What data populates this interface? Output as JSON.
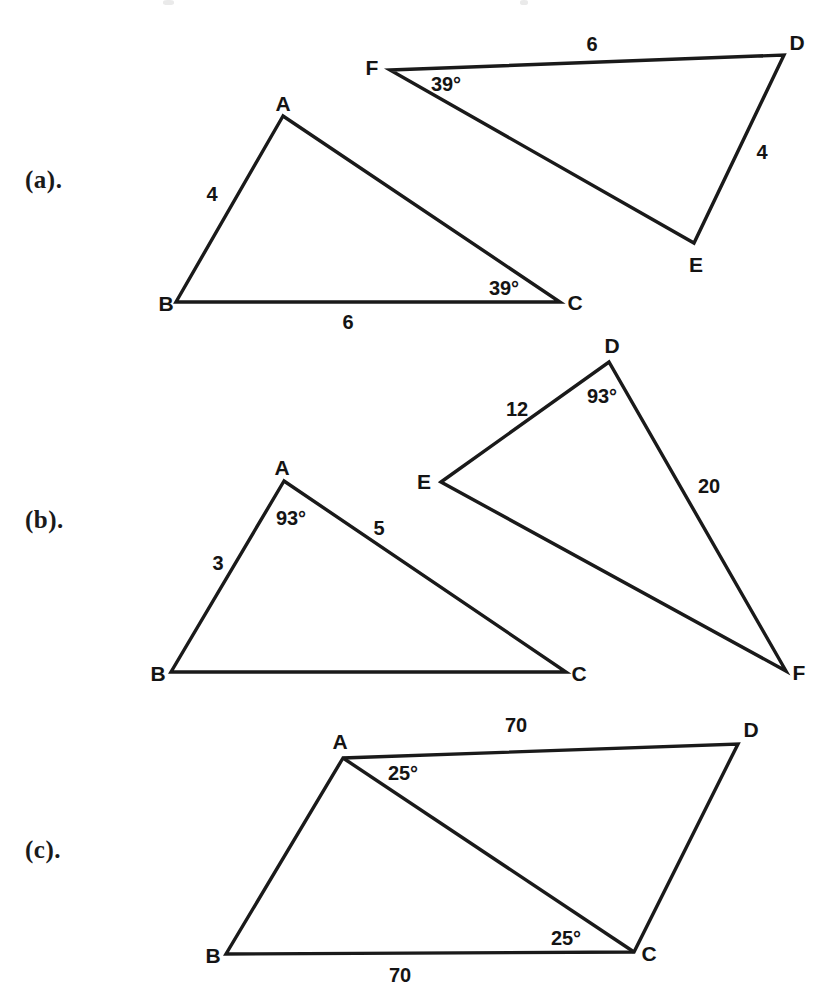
{
  "figure": {
    "stroke_color": "#1a1a1a",
    "background_color": "#ffffff",
    "width": 823,
    "height": 997,
    "parts": [
      {
        "id": "a",
        "label": "(a).",
        "label_x": 25,
        "label_y": 166,
        "shapes": [
          {
            "name": "triangle-abc",
            "points": "283,116 176,302 560,302",
            "closed": true,
            "stroke_width": 3.4
          },
          {
            "name": "triangle-def",
            "points": "390,70 784,55 694,243",
            "closed": true,
            "stroke_width": 3.4
          }
        ],
        "vertices": [
          {
            "name": "vertex-label-a",
            "text": "A",
            "x": 283,
            "y": 104
          },
          {
            "name": "vertex-label-b",
            "text": "B",
            "x": 166,
            "y": 304
          },
          {
            "name": "vertex-label-c",
            "text": "C",
            "x": 575,
            "y": 303
          },
          {
            "name": "vertex-label-d",
            "text": "D",
            "x": 797,
            "y": 43
          },
          {
            "name": "vertex-label-e",
            "text": "E",
            "x": 696,
            "y": 265
          },
          {
            "name": "vertex-label-f",
            "text": "F",
            "x": 372,
            "y": 68
          }
        ],
        "measures": [
          {
            "name": "side-length-ab",
            "text": "4",
            "x": 212,
            "y": 194
          },
          {
            "name": "side-length-bc",
            "text": "6",
            "x": 348,
            "y": 322
          },
          {
            "name": "angle-c",
            "text": "39°",
            "x": 504,
            "y": 288
          },
          {
            "name": "side-length-fd",
            "text": "6",
            "x": 592,
            "y": 44
          },
          {
            "name": "side-length-de",
            "text": "4",
            "x": 762,
            "y": 152
          },
          {
            "name": "angle-f",
            "text": "39°",
            "x": 446,
            "y": 84
          }
        ]
      },
      {
        "id": "b",
        "label": "(b).",
        "label_x": 25,
        "label_y": 506,
        "shapes": [
          {
            "name": "triangle-abc",
            "points": "284,481 171,672 566,672",
            "closed": true,
            "stroke_width": 3.4
          },
          {
            "name": "triangle-def",
            "points": "441,482 609,362 786,671",
            "closed": true,
            "stroke_width": 3.4
          }
        ],
        "vertices": [
          {
            "name": "vertex-label-a",
            "text": "A",
            "x": 282,
            "y": 468
          },
          {
            "name": "vertex-label-b",
            "text": "B",
            "x": 158,
            "y": 674
          },
          {
            "name": "vertex-label-c",
            "text": "C",
            "x": 579,
            "y": 674
          },
          {
            "name": "vertex-label-d",
            "text": "D",
            "x": 612,
            "y": 346
          },
          {
            "name": "vertex-label-e",
            "text": "E",
            "x": 424,
            "y": 482
          },
          {
            "name": "vertex-label-f",
            "text": "F",
            "x": 799,
            "y": 673
          }
        ],
        "measures": [
          {
            "name": "side-length-ab",
            "text": "3",
            "x": 218,
            "y": 563
          },
          {
            "name": "angle-a",
            "text": "93°",
            "x": 291,
            "y": 518
          },
          {
            "name": "side-length-ac",
            "text": "5",
            "x": 379,
            "y": 528
          },
          {
            "name": "side-length-ed",
            "text": "12",
            "x": 517,
            "y": 409
          },
          {
            "name": "angle-d",
            "text": "93°",
            "x": 602,
            "y": 396
          },
          {
            "name": "side-length-df",
            "text": "20",
            "x": 709,
            "y": 486
          }
        ]
      },
      {
        "id": "c",
        "label": "(c).",
        "label_x": 25,
        "label_y": 836,
        "shapes": [
          {
            "name": "quadrilateral-abcd",
            "points": "343,758 226,954 634,952 738,744",
            "closed": true,
            "stroke_width": 3.4
          },
          {
            "name": "diagonal-ac",
            "points": "343,758 634,952",
            "closed": false,
            "stroke_width": 3.4
          }
        ],
        "vertices": [
          {
            "name": "vertex-label-a",
            "text": "A",
            "x": 340,
            "y": 742
          },
          {
            "name": "vertex-label-b",
            "text": "B",
            "x": 213,
            "y": 956
          },
          {
            "name": "vertex-label-c",
            "text": "C",
            "x": 649,
            "y": 954
          },
          {
            "name": "vertex-label-d",
            "text": "D",
            "x": 751,
            "y": 730
          }
        ],
        "measures": [
          {
            "name": "side-length-ad",
            "text": "70",
            "x": 516,
            "y": 725
          },
          {
            "name": "angle-a",
            "text": "25°",
            "x": 403,
            "y": 773
          },
          {
            "name": "angle-c",
            "text": "25°",
            "x": 566,
            "y": 938
          },
          {
            "name": "side-length-bc",
            "text": "70",
            "x": 400,
            "y": 975
          }
        ]
      }
    ]
  }
}
